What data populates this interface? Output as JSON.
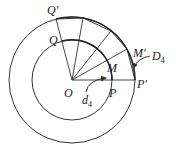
{
  "diagram": {
    "type": "concentric-circles-geometry",
    "labels": {
      "q_prime": "Q'",
      "q": "Q",
      "m_prime": "M'",
      "m": "M",
      "o": "O",
      "p": "P",
      "p_prime": "P'",
      "d_small": "d",
      "d_small_sub": "4",
      "d_big": "D",
      "d_big_sub": "4"
    },
    "colors": {
      "stroke": "#333333",
      "background": "#ffffff"
    }
  }
}
